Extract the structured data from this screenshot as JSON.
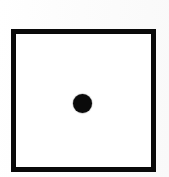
{
  "figure": {
    "name": "square-with-center-dot",
    "canvas": {
      "width": 169,
      "height": 177,
      "background_color": "#fdfdfd"
    },
    "shapes": [
      {
        "id": "square-outline",
        "type": "rectangle",
        "filled": false,
        "stroke_color": "#0a0a0a",
        "stroke_width": 5,
        "fill_color": "#ffffff",
        "x": 11,
        "y": 29,
        "width": 145,
        "height": 143,
        "label": ""
      },
      {
        "id": "center-dot",
        "type": "circle",
        "filled": true,
        "fill_color": "#0a0a0a",
        "stroke_color": "#0a0a0a",
        "center_x": 82,
        "center_y": 103,
        "diameter": 19,
        "radius": 9.5,
        "label": ""
      }
    ],
    "text_elements": [],
    "caption": ""
  },
  "colors": {
    "ink": "#0a0a0a",
    "paper": "#ffffff",
    "page_tint": "#fdfdfd"
  }
}
